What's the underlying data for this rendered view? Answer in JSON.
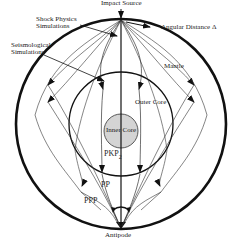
{
  "diagram": {
    "labels": {
      "shock_physics": [
        "Shock Physics",
        "Simulations"
      ],
      "seismological": [
        "Seismological",
        "Simulations"
      ],
      "impact_source": "Impact Source",
      "angular_distance": "Angular Distance Δ",
      "mantle": "Mantle",
      "outer_core": "Outer Core",
      "inner_core": "Inner Core",
      "pkp2": "PKP",
      "pkp2_sub": "2",
      "pp": "PP",
      "ppp": "PPP",
      "antipode": "Antipode"
    },
    "colors": {
      "line": "#111111",
      "inner_core_fill": "#d4d4d4",
      "background": "#ffffff"
    }
  }
}
